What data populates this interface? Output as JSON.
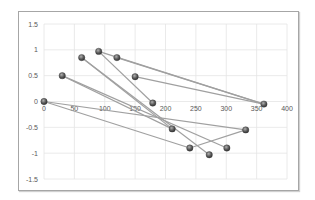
{
  "chart_data": {
    "type": "scatter",
    "title": "",
    "xlabel": "",
    "ylabel": "",
    "xlim": [
      0,
      400
    ],
    "ylim": [
      -1.5,
      1.5
    ],
    "x_ticks": [
      0,
      50,
      100,
      150,
      200,
      250,
      300,
      350,
      400
    ],
    "y_ticks": [
      1.5,
      1,
      0.5,
      0,
      -0.5,
      -1,
      -1.5
    ],
    "x_tick_labels": [
      "0",
      "50",
      "100",
      "150",
      "200",
      "250",
      "300",
      "350",
      "400"
    ],
    "y_tick_labels": [
      "1.5",
      "1",
      "0.5",
      "0",
      "-0.5",
      "-1",
      "-1.5"
    ],
    "grid": true,
    "legend": "none",
    "points": [
      {
        "x": 0,
        "y": 0
      },
      {
        "x": 30,
        "y": 0.5
      },
      {
        "x": 62,
        "y": 0.85
      },
      {
        "x": 90,
        "y": 0.97
      },
      {
        "x": 120,
        "y": 0.85
      },
      {
        "x": 150,
        "y": 0.48
      },
      {
        "x": 179,
        "y": -0.03
      },
      {
        "x": 211,
        "y": -0.53
      },
      {
        "x": 240,
        "y": -0.9
      },
      {
        "x": 272,
        "y": -1.03
      },
      {
        "x": 301,
        "y": -0.9
      },
      {
        "x": 332,
        "y": -0.55
      },
      {
        "x": 362,
        "y": -0.05
      }
    ],
    "segments": [
      [
        [
          0,
          0
        ],
        [
          332,
          -0.55
        ]
      ],
      [
        [
          0,
          0
        ],
        [
          240,
          -0.9
        ]
      ],
      [
        [
          30,
          0.5
        ],
        [
          211,
          -0.53
        ]
      ],
      [
        [
          30,
          0.5
        ],
        [
          301,
          -0.9
        ]
      ],
      [
        [
          62,
          0.85
        ],
        [
          272,
          -1.03
        ]
      ],
      [
        [
          62,
          0.85
        ],
        [
          211,
          -0.53
        ]
      ],
      [
        [
          90,
          0.97
        ],
        [
          179,
          -0.03
        ]
      ],
      [
        [
          90,
          0.97
        ],
        [
          362,
          -0.05
        ]
      ],
      [
        [
          120,
          0.85
        ],
        [
          362,
          -0.05
        ]
      ],
      [
        [
          150,
          0.48
        ],
        [
          362,
          -0.05
        ]
      ],
      [
        [
          240,
          -0.9
        ],
        [
          332,
          -0.55
        ]
      ]
    ],
    "colors": {
      "line": "#a0a0a0",
      "marker": "#5a5a5a",
      "grid": "#e4e4e4",
      "frame": "#a6a6a6"
    }
  }
}
